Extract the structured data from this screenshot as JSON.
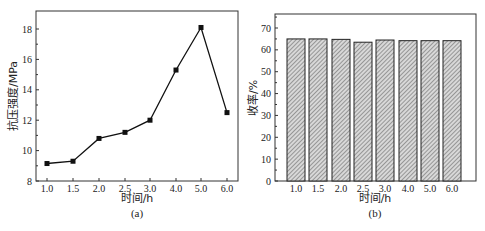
{
  "chart_data": [
    {
      "type": "line",
      "panel": "(a)",
      "title": "",
      "xlabel": "时间/h",
      "ylabel": "抗压强度/MPa",
      "categories": [
        "1.0",
        "1.5",
        "2.0",
        "2.5",
        "3.0",
        "4.0",
        "5.0",
        "6.0"
      ],
      "values": [
        9.15,
        9.3,
        10.8,
        11.2,
        12.0,
        15.3,
        18.1,
        12.5
      ],
      "yticks": [
        8,
        10,
        12,
        14,
        16,
        18
      ],
      "ylim": [
        8,
        19
      ],
      "marker": "square",
      "grid": false,
      "legend": null,
      "caption": "(a)"
    },
    {
      "type": "bar",
      "panel": "(b)",
      "title": "",
      "xlabel": "时间/h",
      "ylabel": "收率/%",
      "categories": [
        "1.0",
        "1.5",
        "2.0",
        "2.5",
        "3.0",
        "4.0",
        "5.0",
        "6.0"
      ],
      "values": [
        65.0,
        65.0,
        64.8,
        63.5,
        64.5,
        64.2,
        64.2,
        64.2
      ],
      "yticks": [
        0,
        10,
        20,
        30,
        40,
        50,
        60,
        70
      ],
      "ylim": [
        0,
        77
      ],
      "bar_fill": "hatched",
      "grid": false,
      "legend": null,
      "caption": "(b)"
    }
  ]
}
